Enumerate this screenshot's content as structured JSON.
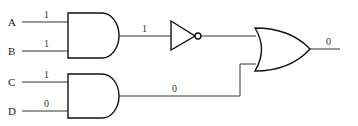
{
  "inputs": [
    {
      "name": "A",
      "value": "1"
    },
    {
      "name": "B",
      "value": "1"
    },
    {
      "name": "C",
      "value": "1"
    },
    {
      "name": "D",
      "value": "0"
    }
  ],
  "gates": [
    {
      "id": "and1",
      "type": "AND",
      "inputs": [
        "A",
        "B"
      ],
      "output_value": "1"
    },
    {
      "id": "not1",
      "type": "NOT",
      "inputs": [
        "and1"
      ],
      "output_value": "0"
    },
    {
      "id": "and2",
      "type": "AND",
      "inputs": [
        "C",
        "D"
      ],
      "output_value": "0"
    },
    {
      "id": "or1",
      "type": "OR",
      "inputs": [
        "not1",
        "and2"
      ],
      "output_value": "0"
    }
  ],
  "wires": {
    "and1_out": "1",
    "not1_out": "0",
    "and2_out": "0",
    "final_out": "0"
  }
}
